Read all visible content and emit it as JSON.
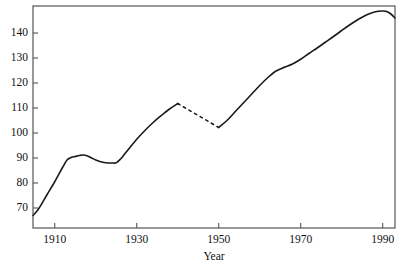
{
  "chart_data": {
    "type": "line",
    "title": "",
    "xlabel": "Year",
    "ylabel": "",
    "xlim": [
      1904.7,
      1993.0
    ],
    "ylim": [
      62.0,
      150.8
    ],
    "grid": false,
    "legend": null,
    "xticks": [
      1910,
      1930,
      1950,
      1970,
      1990
    ],
    "xticklabels": [
      "1910",
      "1930",
      "1950",
      "1970",
      "1990"
    ],
    "yticks": [
      70,
      80,
      90,
      100,
      110,
      120,
      130,
      140
    ],
    "yticklabels": [
      "70",
      "80",
      "90",
      "100",
      "110",
      "120",
      "130",
      "140"
    ],
    "series": [
      {
        "name": "main-solid-early",
        "style": "solid",
        "x": [
          1904.7,
          1906,
          1908,
          1910,
          1912,
          1913,
          1914,
          1915,
          1916,
          1917,
          1918,
          1919,
          1920,
          1921,
          1922,
          1923,
          1924,
          1925,
          1926,
          1927,
          1928,
          1930,
          1932,
          1934,
          1936,
          1938,
          1940
        ],
        "y": [
          67.0,
          69.5,
          75.0,
          80.5,
          86.5,
          89.2,
          90.2,
          90.6,
          91.0,
          91.2,
          90.8,
          90.0,
          89.2,
          88.6,
          88.2,
          88.0,
          88.0,
          88.1,
          89.5,
          91.5,
          93.5,
          97.5,
          101.0,
          104.2,
          107.0,
          109.6,
          111.8
        ]
      },
      {
        "name": "interpolated-gap",
        "style": "dashed",
        "x": [
          1940,
          1942.5,
          1945,
          1947.5,
          1950
        ],
        "y": [
          111.8,
          109.4,
          107.0,
          104.6,
          102.2
        ]
      },
      {
        "name": "main-solid-late",
        "style": "solid",
        "x": [
          1950,
          1952,
          1954,
          1956,
          1958,
          1960,
          1962,
          1964,
          1966,
          1968,
          1970,
          1972,
          1974,
          1976,
          1978,
          1980,
          1982,
          1984,
          1986,
          1988,
          1990,
          1991,
          1992,
          1993
        ],
        "y": [
          102.2,
          105.0,
          108.5,
          112.0,
          115.5,
          119.0,
          122.2,
          124.8,
          126.3,
          127.6,
          129.5,
          131.8,
          134.0,
          136.3,
          138.6,
          141.0,
          143.3,
          145.4,
          147.2,
          148.4,
          148.8,
          148.6,
          147.6,
          146.0
        ]
      }
    ],
    "colors": {
      "line": "#1a1a1a",
      "axis": "#555555",
      "text": "#111111",
      "background": "#ffffff"
    }
  }
}
